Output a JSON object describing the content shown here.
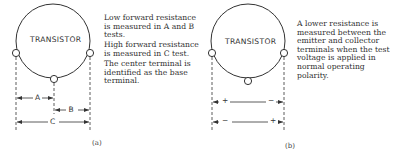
{
  "panel_a": {
    "component_label": "TRANSISTOR",
    "measurements": [
      "A",
      "B",
      "C"
    ],
    "notes": [
      "Low forward resistance is measured in A and B tests.",
      "High forward resistance is measured in C test.",
      "The center terminal is identified as the base terminal."
    ],
    "caption": "(a)"
  },
  "panel_b": {
    "component_label": "TRANSISTOR",
    "polarity_row1": {
      "left": "+",
      "right": "−"
    },
    "polarity_row2": {
      "left": "−",
      "right": "+"
    },
    "notes": [
      "A lower resistance is measured between the emitter and collector terminals when the test voltage is applied in normal operating polarity."
    ],
    "caption": "(b)"
  }
}
